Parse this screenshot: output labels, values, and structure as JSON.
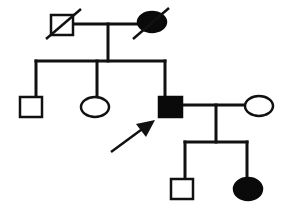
{
  "diagram": {
    "type": "pedigree",
    "colors": {
      "line": "#111111",
      "affected_fill": "#0a0a0a",
      "unaffected_fill": "#ffffff",
      "background": "#ffffff"
    },
    "generations": [
      {
        "index": 1,
        "individuals": [
          {
            "id": "I-1",
            "sex": "male",
            "affected": false,
            "deceased": true
          },
          {
            "id": "I-2",
            "sex": "female",
            "affected": true,
            "deceased": true
          }
        ]
      },
      {
        "index": 2,
        "individuals": [
          {
            "id": "II-1",
            "sex": "male",
            "affected": false,
            "deceased": false
          },
          {
            "id": "II-2",
            "sex": "female",
            "affected": false,
            "deceased": false
          },
          {
            "id": "II-3",
            "sex": "male",
            "affected": true,
            "deceased": false,
            "proband": true
          },
          {
            "id": "II-4",
            "sex": "female",
            "affected": false,
            "deceased": false,
            "spouse_of": "II-3"
          }
        ]
      },
      {
        "index": 3,
        "individuals": [
          {
            "id": "III-1",
            "sex": "male",
            "affected": false,
            "deceased": false
          },
          {
            "id": "III-2",
            "sex": "female",
            "affected": true,
            "deceased": false
          }
        ]
      }
    ],
    "proband_marker": "arrow"
  }
}
